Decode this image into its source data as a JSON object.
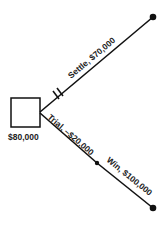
{
  "diagram": {
    "type": "decision-tree",
    "decision_node": {
      "label": "$80,000"
    },
    "branches": [
      {
        "label": "Settle, $70,000",
        "pruned": true
      },
      {
        "label": "Trial, –$20,000",
        "pruned": false
      },
      {
        "label": "Win, $100,000",
        "pruned": false
      }
    ]
  }
}
